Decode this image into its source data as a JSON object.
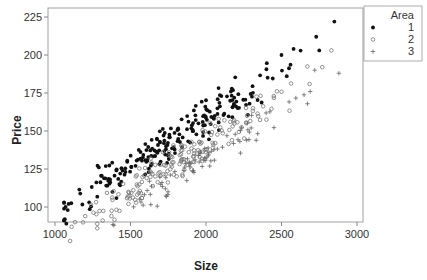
{
  "chart_data": {
    "type": "scatter",
    "title": "",
    "xlabel": "Size",
    "ylabel": "Price",
    "xlim": [
      960,
      3060
    ],
    "ylim": [
      80,
      228
    ],
    "xticks": [
      1000,
      1500,
      2000,
      2500,
      3000
    ],
    "yticks": [
      100,
      125,
      150,
      175,
      200,
      225
    ],
    "grid": false,
    "legend": {
      "title": "Area",
      "position": "top-right-outside",
      "entries": [
        {
          "label": "1",
          "marker": "filled-circle"
        },
        {
          "label": "2",
          "marker": "open-circle"
        },
        {
          "label": "3",
          "marker": "plus"
        }
      ]
    },
    "series": [
      {
        "name": "1",
        "marker": "filled-circle",
        "trend": {
          "slope": 0.0645,
          "intercept": 29,
          "spread": 6
        },
        "x_range": [
          1060,
          2850
        ],
        "n_points": 220,
        "sample_points": [
          [
            1065,
            92
          ],
          [
            1070,
            100
          ],
          [
            1075,
            89
          ],
          [
            1090,
            102
          ],
          [
            2850,
            222
          ],
          [
            2730,
            212
          ],
          [
            2750,
            203
          ],
          [
            2580,
            204
          ],
          [
            2500,
            200
          ]
        ]
      },
      {
        "name": "2",
        "marker": "open-circle",
        "trend": {
          "slope": 0.0625,
          "intercept": 16,
          "spread": 6
        },
        "x_range": [
          1100,
          2830
        ],
        "n_points": 180,
        "sample_points": [
          [
            1110,
            87
          ],
          [
            1280,
            86
          ],
          [
            1200,
            94
          ],
          [
            2830,
            203
          ],
          [
            2770,
            192
          ]
        ]
      },
      {
        "name": "3",
        "marker": "plus",
        "trend": {
          "slope": 0.061,
          "intercept": 10,
          "spread": 5
        },
        "x_range": [
          1380,
          2880
        ],
        "n_points": 80,
        "sample_points": [
          [
            1390,
            88
          ],
          [
            2880,
            188
          ],
          [
            2720,
            190
          ],
          [
            2690,
            176
          ]
        ]
      }
    ]
  }
}
